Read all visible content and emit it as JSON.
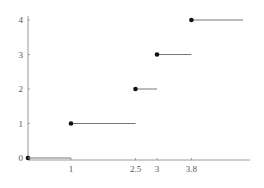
{
  "chart_data": {
    "type": "line",
    "subtype": "step",
    "title": "",
    "xlabel": "",
    "ylabel": "",
    "xlim": [
      0,
      5.2
    ],
    "ylim": [
      0,
      4
    ],
    "grid": false,
    "legend": null,
    "x_ticks": [
      {
        "value": 1,
        "label": "1"
      },
      {
        "value": 2.5,
        "label": "2.5"
      },
      {
        "value": 3,
        "label": "3"
      },
      {
        "value": 3.8,
        "label": "3.8"
      }
    ],
    "y_ticks": [
      {
        "value": 0,
        "label": "0"
      },
      {
        "value": 1,
        "label": "1"
      },
      {
        "value": 2,
        "label": "2"
      },
      {
        "value": 3,
        "label": "3"
      },
      {
        "value": 4,
        "label": "4"
      }
    ],
    "segments": [
      {
        "x_start": 0,
        "x_end": 1,
        "y": 0,
        "closed_start": true
      },
      {
        "x_start": 1,
        "x_end": 2.5,
        "y": 1,
        "closed_start": true
      },
      {
        "x_start": 2.5,
        "x_end": 3,
        "y": 2,
        "closed_start": true
      },
      {
        "x_start": 3,
        "x_end": 3.8,
        "y": 3,
        "closed_start": true
      },
      {
        "x_start": 3.8,
        "x_end": 5,
        "y": 4,
        "closed_start": true
      }
    ],
    "colors": {
      "axis": "#9a9a9a",
      "segment": "#777777",
      "point": "#111111",
      "label": "#555555"
    }
  }
}
